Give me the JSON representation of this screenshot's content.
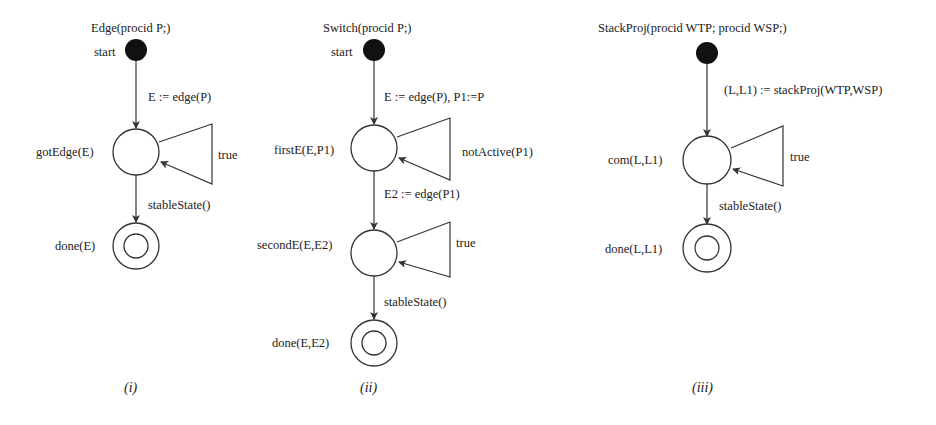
{
  "colors": {
    "line": "#333333",
    "text": "#222222",
    "start_dot": "#111111",
    "background": "#ffffff"
  },
  "diagrams": [
    {
      "caption": "(i)",
      "title": "Edge(procid P;)",
      "start_label": "start",
      "transitions": [
        "E := edge(P)",
        "true",
        "stableState()"
      ],
      "states": [
        "gotEdge(E)",
        "done(E)"
      ]
    },
    {
      "caption": "(ii)",
      "title": "Switch(procid P;)",
      "start_label": "start",
      "transitions": [
        "E := edge(P), P1:=P",
        "notActive(P1)",
        "E2 := edge(P1)",
        "true",
        "stableState()"
      ],
      "states": [
        "firstE(E,P1)",
        "secondE(E,E2)",
        "done(E,E2)"
      ]
    },
    {
      "caption": "(iii)",
      "title": "StackProj(procid WTP; procid WSP;)",
      "start_label": "",
      "transitions": [
        "(L,L1) := stackProj(WTP,WSP)",
        "true",
        "stableState()"
      ],
      "states": [
        "com(L,L1)",
        "done(L,L1)"
      ]
    }
  ]
}
